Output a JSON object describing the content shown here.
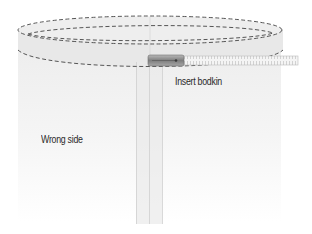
{
  "diagram": {
    "type": "sewing-illustration",
    "labels": {
      "bodkin": "Insert bodkin",
      "fabric_side": "Wrong side"
    },
    "colors": {
      "background": "#ffffff",
      "fabric_top": "#ececec",
      "fabric_bottom": "#ffffff",
      "casing": "#e6e6e6",
      "stitch": "#555555",
      "edge": "#bdbdbd",
      "bodkin_metal": "#8f8f8f",
      "tape": "#f2f2f2",
      "text": "#2a2a2a"
    },
    "elements": [
      {
        "id": "casing-outer-ellipse",
        "kind": "dashed-stitch"
      },
      {
        "id": "casing-inner-ellipse",
        "kind": "dashed-stitch"
      },
      {
        "id": "casing-lower-edge",
        "kind": "dashed-stitch"
      },
      {
        "id": "tube-body",
        "kind": "fabric"
      },
      {
        "id": "center-seam",
        "kind": "seam-allowance"
      },
      {
        "id": "bodkin",
        "kind": "tool"
      },
      {
        "id": "elastic-tape",
        "kind": "tape"
      }
    ]
  }
}
